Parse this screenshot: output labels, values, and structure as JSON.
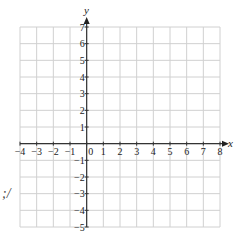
{
  "chart_data": {
    "type": "scatter",
    "title": "",
    "xlabel": "x",
    "ylabel": "y",
    "xlim": [
      -4,
      8
    ],
    "ylim": [
      -5,
      7
    ],
    "grid": true,
    "x_ticks": [
      "-4",
      "-3",
      "-2",
      "-1",
      "0",
      "1",
      "2",
      "3",
      "4",
      "5",
      "6",
      "7",
      "8"
    ],
    "y_ticks": [
      "7",
      "6",
      "5",
      "4",
      "3",
      "2",
      "1",
      "-1",
      "-2",
      "-3",
      "-4",
      "-5"
    ],
    "series": [],
    "annotations": []
  },
  "stray_text": ";/"
}
